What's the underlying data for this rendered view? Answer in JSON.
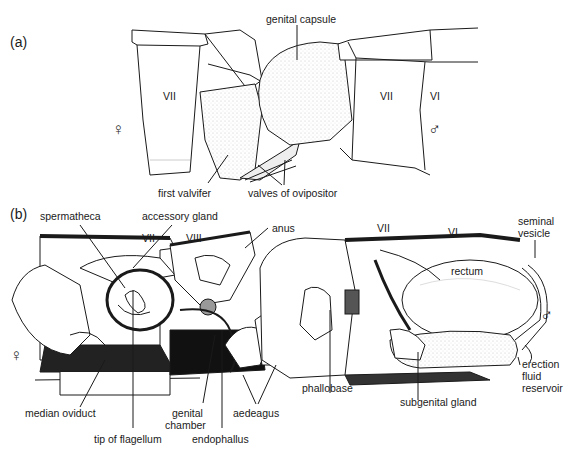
{
  "figure": {
    "panel_a": {
      "label": "(a)",
      "labels": {
        "genital_capsule": "genital capsule",
        "first_valvifer": "first valvifer",
        "valves_of_ovipositor": "valves of ovipositor"
      },
      "segments": {
        "female_vii": "VII",
        "male_vii": "VII",
        "male_vi": "VI"
      },
      "symbols": {
        "female": "♀",
        "male": "♂"
      }
    },
    "panel_b": {
      "label": "(b)",
      "labels": {
        "spermatheca": "spermatheca",
        "accessory_gland": "accessory gland",
        "anus": "anus",
        "seminal_vesicle_1": "seminal",
        "seminal_vesicle_2": "vesicle",
        "rectum": "rectum",
        "erection_1": "erection",
        "erection_2": "fluid",
        "erection_3": "reservoir",
        "median_oviduct": "median oviduct",
        "genital_chamber_1": "genital",
        "genital_chamber_2": "chamber",
        "tip_of_flagellum": "tip of flagellum",
        "endophallus": "endophallus",
        "aedeagus": "aedeagus",
        "phallobase": "phallobase",
        "subgenital_gland": "subgenital gland"
      },
      "segments": {
        "female_vii": "VII",
        "female_viii": "VIII",
        "male_vii": "VII",
        "male_vi": "VI"
      },
      "symbols": {
        "female": "♀",
        "male": "♂"
      }
    },
    "colors": {
      "ink": "#1a1a1a",
      "stipple": "#d8d8d8",
      "background": "#ffffff"
    }
  }
}
